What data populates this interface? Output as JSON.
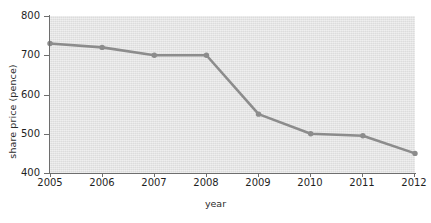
{
  "chart_data": {
    "type": "line",
    "title": "",
    "xlabel": "year",
    "ylabel": "share price (pence)",
    "categories": [
      2005,
      2006,
      2007,
      2008,
      2009,
      2010,
      2011,
      2012
    ],
    "x": [
      2005,
      2006,
      2007,
      2008,
      2009,
      2010,
      2011,
      2012
    ],
    "values": [
      730,
      720,
      700,
      700,
      550,
      500,
      495,
      450
    ],
    "series": [
      {
        "name": "share price",
        "values": [
          730,
          720,
          700,
          700,
          550,
          500,
          495,
          450
        ]
      }
    ],
    "xlim": [
      2005,
      2012
    ],
    "ylim": [
      400,
      800
    ],
    "ytick_labels": [
      "800",
      "700",
      "600",
      "500",
      "400"
    ],
    "ytick_values": [
      800,
      700,
      600,
      500,
      400
    ],
    "xtick_labels": [
      "2005",
      "2006",
      "2007",
      "2008",
      "2009",
      "2010",
      "2011",
      "2012"
    ],
    "grid": false,
    "legend": null,
    "legend_position": "none",
    "marker": "circle",
    "colors": {
      "line": "#8c8c8c",
      "marker": "#8c8c8c",
      "plot_background": "#e2e2e2",
      "axis": "#6e6e6e",
      "text": "#1f1f1f",
      "figure_background": "#ffffff"
    }
  },
  "axes": {
    "y_title": "share price (pence)",
    "x_title": "year"
  }
}
